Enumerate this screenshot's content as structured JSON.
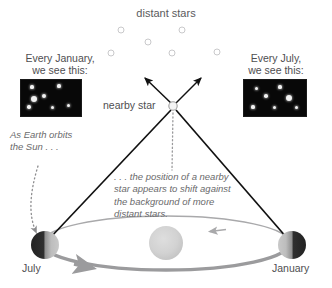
{
  "diagram": {
    "title": "distant stars",
    "nearby_star_label": "nearby star",
    "january_caption": "Every January,\nwe see this:",
    "july_caption": "Every July,\nwe see this:",
    "note_earth_orbits": "As Earth orbits the Sun . . .",
    "note_parallax": ". . . the position of a nearby star appears to shift against the background of more distant stars.",
    "earth_july_label": "July",
    "earth_january_label": "January",
    "colors": {
      "background": "#ffffff",
      "text": "#58585a",
      "italic_text": "#6a6a6c",
      "sight_line": "#111111",
      "orbit_line": "#a9a9ab",
      "orbit_line_thick": "#9b9b9d",
      "sun_fill": "#cfcfcf",
      "earth_dark": "#2e2e2e",
      "earth_light": "#b6b6b6",
      "distant_star_stroke": "#c9c9cb",
      "starfield_background": "#080808",
      "starfield_star": "#f2f2f2"
    }
  },
  "chart_data": {
    "type": "scatter",
    "title": "distant stars",
    "xlabel": "",
    "ylabel": "",
    "distant_stars": [
      {
        "x": 121,
        "y": 30,
        "r": 3
      },
      {
        "x": 182,
        "y": 30,
        "r": 3
      },
      {
        "x": 148,
        "y": 42,
        "r": 3
      },
      {
        "x": 111,
        "y": 53,
        "r": 3
      },
      {
        "x": 172,
        "y": 53,
        "r": 3
      },
      {
        "x": 217,
        "y": 52,
        "r": 3
      }
    ],
    "nearby_star": {
      "x": 173,
      "y": 106,
      "r": 4
    },
    "sun": {
      "x": 166,
      "y": 243,
      "r": 17
    },
    "earth_positions": [
      {
        "label": "July",
        "x": 45,
        "y": 245,
        "r": 14,
        "shadow_side": "left"
      },
      {
        "label": "January",
        "x": 292,
        "y": 245,
        "r": 14,
        "shadow_side": "right"
      }
    ],
    "orbit": {
      "cx": 166,
      "cy": 243,
      "rx": 124,
      "ry": 27
    },
    "sight_lines": [
      {
        "from": [
          45,
          245
        ],
        "to": [
          173,
          106
        ]
      },
      {
        "from": [
          292,
          245
        ],
        "to": [
          173,
          106
        ]
      }
    ],
    "view_arrows": [
      {
        "from": [
          173,
          106
        ],
        "to": [
          144,
          77
        ]
      },
      {
        "from": [
          173,
          106
        ],
        "to": [
          202,
          77
        ]
      }
    ],
    "starfield_january": {
      "width": 60,
      "height": 36,
      "stars": [
        {
          "x": 11,
          "y": 7,
          "r": 1.6
        },
        {
          "x": 38,
          "y": 6,
          "r": 1.6
        },
        {
          "x": 23,
          "y": 16,
          "r": 2.4
        },
        {
          "x": 13,
          "y": 19,
          "r": 3.0
        },
        {
          "x": 8,
          "y": 27,
          "r": 1.7
        },
        {
          "x": 31,
          "y": 27,
          "r": 1.5
        },
        {
          "x": 47,
          "y": 25,
          "r": 1.5
        }
      ]
    },
    "starfield_july": {
      "width": 62,
      "height": 36,
      "stars": [
        {
          "x": 12,
          "y": 8,
          "r": 1.5
        },
        {
          "x": 36,
          "y": 7,
          "r": 1.6
        },
        {
          "x": 22,
          "y": 16,
          "r": 1.8
        },
        {
          "x": 45,
          "y": 18,
          "r": 3.0
        },
        {
          "x": 9,
          "y": 27,
          "r": 1.6
        },
        {
          "x": 30,
          "y": 27,
          "r": 1.5
        },
        {
          "x": 52,
          "y": 27,
          "r": 1.5
        }
      ]
    }
  }
}
